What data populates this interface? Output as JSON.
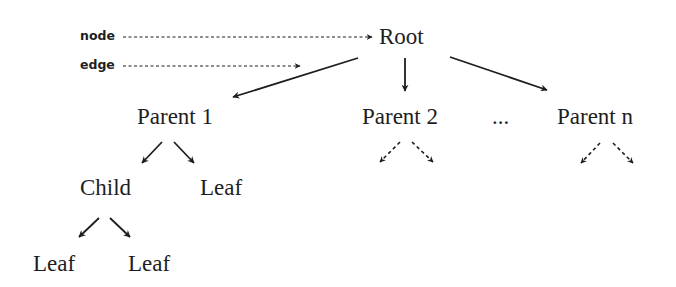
{
  "legend": {
    "node_label": "node",
    "edge_label": "edge"
  },
  "nodes": {
    "root": "Root",
    "parent1": "Parent 1",
    "parent2": "Parent 2",
    "ellipsis": "...",
    "parentn": "Parent n",
    "child": "Child",
    "leaf_p1": "Leaf",
    "leaf_c1": "Leaf",
    "leaf_c2": "Leaf"
  },
  "edges": [
    {
      "from": "root",
      "to": "parent1",
      "style": "solid"
    },
    {
      "from": "root",
      "to": "parent2",
      "style": "solid"
    },
    {
      "from": "root",
      "to": "parentn",
      "style": "solid"
    },
    {
      "from": "parent1",
      "to": "child",
      "style": "solid"
    },
    {
      "from": "parent1",
      "to": "leaf_p1",
      "style": "solid"
    },
    {
      "from": "child",
      "to": "leaf_c1",
      "style": "solid"
    },
    {
      "from": "child",
      "to": "leaf_c2",
      "style": "solid"
    },
    {
      "from": "parent2",
      "to": "(omitted)",
      "style": "dashed"
    },
    {
      "from": "parent2",
      "to": "(omitted)",
      "style": "dashed"
    },
    {
      "from": "parentn",
      "to": "(omitted)",
      "style": "dashed"
    },
    {
      "from": "parentn",
      "to": "(omitted)",
      "style": "dashed"
    }
  ],
  "colors": {
    "ink": "#1e1e1e",
    "background": "#ffffff"
  }
}
